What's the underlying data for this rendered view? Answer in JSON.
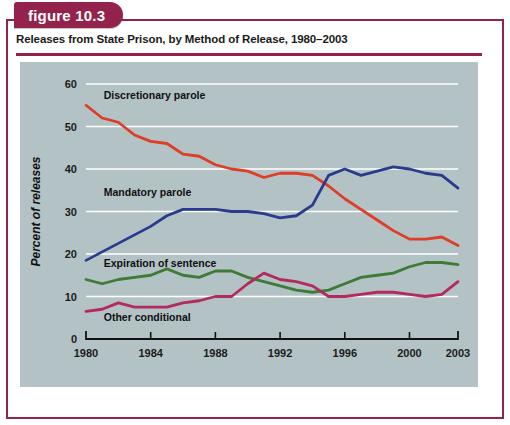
{
  "figure": {
    "tab_label": "figure 10.3",
    "title": "Releases from State Prison, by Method of Release, 1980–2003",
    "frame_color": "#93234C",
    "tab_color": "#93234C",
    "panel_color": "#b3c2c4"
  },
  "chart_data": {
    "type": "line",
    "title": "Releases from State Prison, by Method of Release, 1980–2003",
    "xlabel": "",
    "ylabel": "Percent of releases",
    "xlim": [
      1980,
      2003
    ],
    "ylim": [
      0,
      60
    ],
    "grid": "horizontal",
    "legend": "inline-labels",
    "yticks": [
      0,
      10,
      20,
      30,
      40,
      50,
      60
    ],
    "ytick_labels": [
      "0",
      "10",
      "20",
      "30",
      "40",
      "50",
      "60"
    ],
    "xticks": [
      1980,
      1984,
      1988,
      1992,
      1996,
      2000,
      2003
    ],
    "xtick_labels": [
      "1980",
      "1984",
      "1988",
      "1992",
      "1996",
      "2000",
      "2003"
    ],
    "x": [
      1980,
      1981,
      1982,
      1983,
      1984,
      1985,
      1986,
      1987,
      1988,
      1989,
      1990,
      1991,
      1992,
      1993,
      1994,
      1995,
      1996,
      1997,
      1998,
      1999,
      2000,
      2001,
      2002,
      2003
    ],
    "series": [
      {
        "name": "Discretionary parole",
        "color": "#DE3D26",
        "label_x": 1981.1,
        "label_y": 57.5,
        "values": [
          55.0,
          52.0,
          51.0,
          48.0,
          46.5,
          46.0,
          43.5,
          43.0,
          41.0,
          40.0,
          39.5,
          38.0,
          39.0,
          39.0,
          38.5,
          36.0,
          33.0,
          30.5,
          28.0,
          25.5,
          23.5,
          23.5,
          24.0,
          22.0
        ]
      },
      {
        "name": "Mandatory parole",
        "color": "#2A3A8C",
        "label_x": 1981.1,
        "label_y": 34.5,
        "values": [
          18.5,
          20.5,
          22.5,
          24.5,
          26.5,
          29.0,
          30.5,
          30.5,
          30.5,
          30.0,
          30.0,
          29.5,
          28.5,
          29.0,
          31.5,
          38.5,
          40.0,
          38.5,
          39.5,
          40.5,
          40.0,
          39.0,
          38.5,
          35.5
        ]
      },
      {
        "name": "Expiration of sentence",
        "color": "#3F7A36",
        "label_x": 1981.1,
        "label_y": 18.0,
        "values": [
          14.0,
          13.0,
          14.0,
          14.5,
          15.0,
          16.5,
          15.0,
          14.5,
          16.0,
          16.0,
          14.5,
          13.5,
          12.5,
          11.5,
          11.0,
          11.5,
          13.0,
          14.5,
          15.0,
          15.5,
          17.0,
          18.0,
          18.0,
          17.5
        ]
      },
      {
        "name": "Other conditional",
        "color": "#B32A5E",
        "label_x": 1981.1,
        "label_y": 5.2,
        "values": [
          6.5,
          7.0,
          8.5,
          7.5,
          7.5,
          7.5,
          8.5,
          9.0,
          10.0,
          10.0,
          13.0,
          15.5,
          14.0,
          13.5,
          12.5,
          10.0,
          10.0,
          10.5,
          11.0,
          11.0,
          10.5,
          10.0,
          10.5,
          13.5
        ]
      }
    ]
  }
}
